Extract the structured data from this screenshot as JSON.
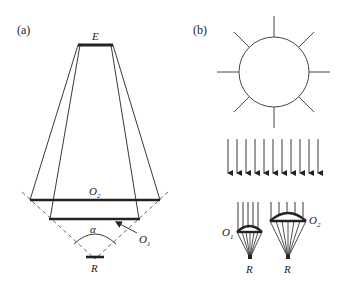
{
  "panels": {
    "a": {
      "label": "(a)",
      "source_label": "E",
      "outer_screen_label": "O",
      "outer_screen_sub": "2",
      "inner_screen_label": "O",
      "inner_screen_sub": "1",
      "angle_label": "α",
      "receiver_label": "R"
    },
    "b": {
      "label": "(b)",
      "sun_rays": 8,
      "parallel_arrows": 11,
      "parachute_1_label": "O",
      "parachute_1_sub": "1",
      "parachute_2_label": "O",
      "parachute_2_sub": "2",
      "receiver_1_label": "R",
      "receiver_2_label": "R"
    }
  },
  "colors": {
    "stroke": "#222222",
    "background": "#ffffff",
    "dashed": "#555555"
  }
}
